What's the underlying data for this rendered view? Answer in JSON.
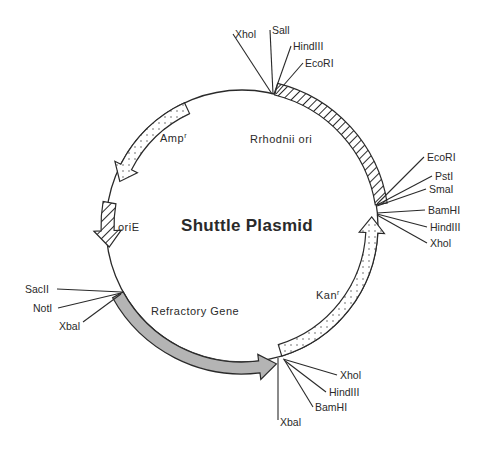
{
  "title": "Shuttle Plasmid",
  "colors": {
    "line": "#2a2a2a",
    "refractory_fill": "#b4b4b4",
    "resistance_fill": "#ffffff",
    "background": "#ffffff"
  },
  "circle": {
    "cx": 242,
    "cy": 226,
    "r": 136
  },
  "features": [
    {
      "id": "ampr",
      "label": "Amp",
      "superscript": "r",
      "pattern": "dotted",
      "direction": "counterclockwise",
      "start_deg": 245,
      "end_deg": 199
    },
    {
      "id": "orie",
      "label": "oriE",
      "pattern": "hatched",
      "direction": "counterclockwise",
      "start_deg": 190,
      "end_deg": 170
    },
    {
      "id": "rrhodnii-ori",
      "label": "Rrhodnii ori",
      "pattern": "hatched",
      "direction": "none",
      "start_deg": -76,
      "end_deg": -9
    },
    {
      "id": "kanr",
      "label": "Kan",
      "superscript": "r",
      "pattern": "dotted",
      "direction": "counterclockwise",
      "start_deg": 73,
      "end_deg": -5
    },
    {
      "id": "refractory-gene",
      "label": "Refractory Gene",
      "pattern": "gray",
      "direction": "counterclockwise-to-clockwise",
      "start_deg": 151,
      "end_deg": 75
    }
  ],
  "site_clusters": [
    {
      "position": "top",
      "sites": [
        "XhoI",
        "SalI",
        "HindIII",
        "EcoRI"
      ]
    },
    {
      "position": "right-upper",
      "sites": [
        "EcoRI",
        "PstI",
        "SmaI"
      ]
    },
    {
      "position": "right-lower",
      "sites": [
        "BamHI",
        "HindIII",
        "XhoI"
      ]
    },
    {
      "position": "bottom",
      "sites": [
        "XbaI",
        "XhoI",
        "HindIII",
        "BamHI"
      ]
    },
    {
      "position": "left",
      "sites": [
        "SacII",
        "NotI",
        "XbaI"
      ]
    }
  ],
  "labels": {
    "top": {
      "xhoi": "Xhol",
      "sali": "Sall",
      "hindiii": "HindIII",
      "ecori": "EcoRI"
    },
    "right_upper": {
      "ecori": "EcoRI",
      "psti": "PstI",
      "smai": "SmaI"
    },
    "right_lower": {
      "bamhi": "BamHI",
      "hindiii": "HindIII",
      "xhoi": "Xhol"
    },
    "bottom": {
      "xhoi": "Xhol",
      "hindiii": "HindIII",
      "bamhi": "BamHI",
      "xbai": "Xbal"
    },
    "left": {
      "sacii": "SacII",
      "noti": "NotI",
      "xbai": "Xbal"
    },
    "features": {
      "amp": "Amp",
      "amp_sup": "r",
      "orie": "oriE",
      "rrhodnii": "Rrhodnii ori",
      "kan": "Kan",
      "kan_sup": "r",
      "refractory": "Refractory Gene"
    }
  }
}
